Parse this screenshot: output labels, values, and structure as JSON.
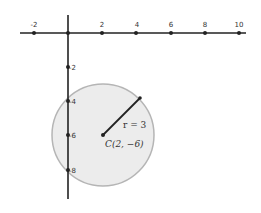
{
  "diagram": {
    "type": "coordinate-plane-circle",
    "x_axis": {
      "tick_labels": [
        "-2",
        "2",
        "4",
        "6",
        "8",
        "10"
      ],
      "tick_values": [
        -2,
        2,
        4,
        6,
        8,
        10
      ]
    },
    "y_axis": {
      "tick_labels": [
        "-2",
        "-4",
        "-6",
        "-8"
      ],
      "tick_values": [
        -2,
        -4,
        -6,
        -8
      ]
    },
    "circle": {
      "center": [
        2,
        -6
      ],
      "radius": 3,
      "fill": "#ececec",
      "stroke": "#b0b0b0"
    },
    "labels": {
      "radius": "r = 3",
      "center": "C(2, −6)"
    }
  }
}
